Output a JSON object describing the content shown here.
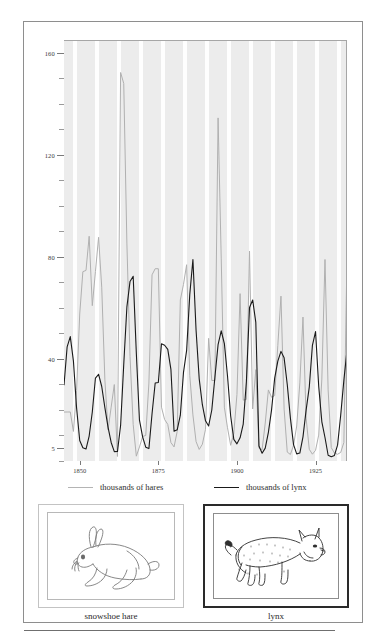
{
  "figure": {
    "panels": [
      {
        "name": "snowshoe-hare",
        "caption": "snowshoe hare",
        "icon": "hare-illustration"
      },
      {
        "name": "lynx",
        "caption": "lynx",
        "icon": "lynx-illustration"
      }
    ]
  },
  "legend": {
    "position": "below-axis",
    "entries": [
      {
        "label": "thousands of hares",
        "color": "#b4b4b4"
      },
      {
        "label": "thousands of lynx",
        "color": "#1a1a1a"
      }
    ]
  },
  "chart_data": {
    "type": "line",
    "title": "",
    "subtitle": "",
    "xlabel": "",
    "ylabel": "",
    "grid": "vertical-bands",
    "legend_position": "bottom",
    "xlim": [
      1845,
      1935
    ],
    "ylim": [
      0,
      165
    ],
    "xticks": [
      1850,
      1875,
      1900,
      1925
    ],
    "xtick_labels": [
      "1850",
      "1875",
      "1900",
      "1925"
    ],
    "yticks": [
      5,
      40,
      80,
      120,
      160
    ],
    "ytick_labels": [
      "5",
      "40",
      "80",
      "120",
      "160"
    ],
    "yminor_step": 10,
    "x": [
      1845,
      1846,
      1847,
      1848,
      1849,
      1850,
      1851,
      1852,
      1853,
      1854,
      1855,
      1856,
      1857,
      1858,
      1859,
      1860,
      1861,
      1862,
      1863,
      1864,
      1865,
      1866,
      1867,
      1868,
      1869,
      1870,
      1871,
      1872,
      1873,
      1874,
      1875,
      1876,
      1877,
      1878,
      1879,
      1880,
      1881,
      1882,
      1883,
      1884,
      1885,
      1886,
      1887,
      1888,
      1889,
      1890,
      1891,
      1892,
      1893,
      1894,
      1895,
      1896,
      1897,
      1898,
      1899,
      1900,
      1901,
      1902,
      1903,
      1904,
      1905,
      1906,
      1907,
      1908,
      1909,
      1910,
      1911,
      1912,
      1913,
      1914,
      1915,
      1916,
      1917,
      1918,
      1919,
      1920,
      1921,
      1922,
      1923,
      1924,
      1925,
      1926,
      1927,
      1928,
      1929,
      1930,
      1931,
      1932,
      1933,
      1934,
      1935
    ],
    "series": [
      {
        "name": "thousands of hares",
        "color": "#b0b0b0",
        "values": [
          19.58,
          19.6,
          19.61,
          11.99,
          28.04,
          58.0,
          74.6,
          75.09,
          88.48,
          61.28,
          74.67,
          88.06,
          68.51,
          32.19,
          12.64,
          21.49,
          30.35,
          2.18,
          152.65,
          148.36,
          85.81,
          41.41,
          14.75,
          2.28,
          5.91,
          9.95,
          10.44,
          30.93,
          73.36,
          75.76,
          75.76,
          21.49,
          16.65,
          14.75,
          7.62,
          5.91,
          11.99,
          63.51,
          69.63,
          77.32,
          33.96,
          18.46,
          8.0,
          4.92,
          6.97,
          12.81,
          48.46,
          31.94,
          31.97,
          134.86,
          79.9,
          21.49,
          13.42,
          6.54,
          11.25,
          26.44,
          65.99,
          24.24,
          24.53,
          82.69,
          20.78,
          36.19,
          5.44,
          4.8,
          15.28,
          28.25,
          25.38,
          26.03,
          45.7,
          65.01,
          20.73,
          3.88,
          2.96,
          6.52,
          14.1,
          31.0,
          56.81,
          17.17,
          4.98,
          3.06,
          4.58,
          10.55,
          32.49,
          79.37,
          28.27,
          5.64,
          3.52,
          3.03,
          3.75,
          7.65,
          80.85
        ]
      },
      {
        "name": "thousands of lynx",
        "color": "#1a1a1a",
        "values": [
          30.09,
          45.15,
          49.15,
          39.52,
          21.23,
          8.42,
          5.56,
          5.08,
          10.17,
          19.6,
          32.91,
          34.38,
          29.59,
          21.3,
          13.69,
          7.65,
          4.08,
          4.09,
          14.33,
          38.22,
          60.78,
          70.77,
          72.77,
          42.68,
          16.39,
          9.83,
          5.8,
          5.26,
          18.91,
          30.95,
          31.18,
          46.34,
          45.77,
          44.15,
          36.33,
          12.03,
          12.6,
          18.34,
          35.14,
          43.77,
          65.69,
          79.35,
          51.65,
          32.59,
          22.45,
          16.16,
          14.12,
          20.38,
          33.33,
          46.0,
          51.41,
          46.43,
          33.68,
          18.01,
          8.86,
          7.13,
          9.47,
          14.86,
          31.47,
          60.57,
          63.51,
          54.7,
          6.3,
          3.41,
          5.44,
          11.65,
          20.35,
          32.88,
          39.55,
          43.36,
          40.83,
          30.36,
          17.18,
          6.82,
          3.19,
          3.52,
          9.86,
          20.35,
          29.35,
          45.72,
          51.1,
          29.7,
          15.76,
          9.6,
          2.65,
          2.06,
          2.58,
          6.61,
          18.4,
          32.01,
          43.8
        ]
      }
    ]
  }
}
